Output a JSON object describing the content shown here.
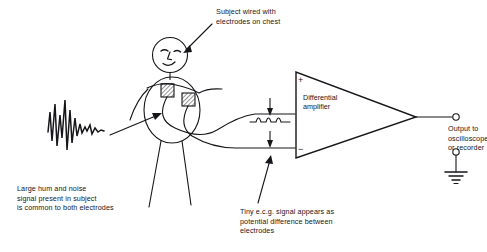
{
  "figure": {
    "ink_color": "#16161a",
    "background": "#ffffff"
  },
  "captions": {
    "subject": "Subject wired with\nelectrodes on chest",
    "noise": "Large hum and noise\nsignal present in subject\nis common to both electrodes",
    "ecg": "Tiny e.c.g. signal appears as\npotential difference between\nelectrodes",
    "output": "Output to\noscilloscope\nor recorder"
  },
  "amplifier": {
    "label": "Differential\namplifier",
    "plus_input": "+",
    "minus_input": "−"
  },
  "icons": {
    "subject": "stick-figure-icon",
    "electrode_left": "electrode-patch-icon",
    "electrode_right": "electrode-patch-icon",
    "noise_waveform": "noise-waveform-icon",
    "ecg_waveform": "ecg-waveform-icon",
    "amplifier": "triangle-amplifier-icon",
    "output_terminal_top": "terminal-post-icon",
    "output_terminal_bottom": "terminal-post-icon",
    "ground": "earth-ground-icon",
    "arrow_subject": "pointer-arrow-icon",
    "arrow_noise": "pointer-arrow-icon",
    "arrow_ecg": "pointer-arrow-icon",
    "arrow_potential_upper": "down-arrow-icon",
    "arrow_potential_lower": "down-arrow-icon"
  }
}
